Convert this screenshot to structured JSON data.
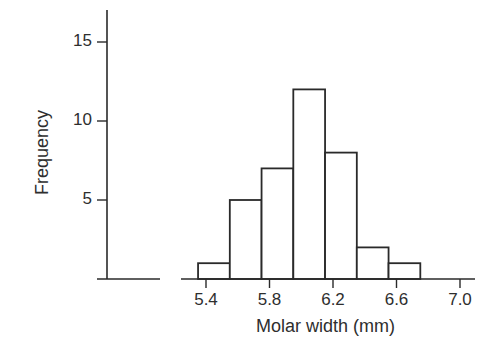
{
  "chart_data": {
    "type": "bar",
    "subtype": "histogram",
    "title": "",
    "xlabel": "Molar width (mm)",
    "ylabel": "Frequency",
    "bin_width": 0.2,
    "bins": [
      {
        "start": 5.35,
        "end": 5.55,
        "count": 1
      },
      {
        "start": 5.55,
        "end": 5.75,
        "count": 5
      },
      {
        "start": 5.75,
        "end": 5.95,
        "count": 7
      },
      {
        "start": 5.95,
        "end": 6.15,
        "count": 12
      },
      {
        "start": 6.15,
        "end": 6.35,
        "count": 8
      },
      {
        "start": 6.35,
        "end": 6.55,
        "count": 2
      },
      {
        "start": 6.55,
        "end": 6.75,
        "count": 1
      }
    ],
    "categories": [
      "5.35-5.55",
      "5.55-5.75",
      "5.75-5.95",
      "5.95-6.15",
      "6.15-6.35",
      "6.35-6.55",
      "6.55-6.75"
    ],
    "values": [
      1,
      5,
      7,
      12,
      8,
      2,
      1
    ],
    "x_ticks": [
      "5.4",
      "5.8",
      "6.2",
      "6.6",
      "7.0"
    ],
    "y_ticks": [
      "5",
      "10",
      "15"
    ],
    "xlim": [
      5.4,
      7.0
    ],
    "ylim": [
      0,
      17
    ],
    "grid": false,
    "legend": null,
    "colors": {
      "bar_fill": "#ffffff",
      "bar_stroke": "#2a2a2a",
      "axis": "#2a2a2a"
    }
  },
  "axes": {
    "xlabel": "Molar width (mm)",
    "ylabel": "Frequency",
    "x_ticks": [
      "5.4",
      "5.8",
      "6.2",
      "6.6",
      "7.0"
    ],
    "y_ticks": [
      "5",
      "10",
      "15"
    ]
  }
}
